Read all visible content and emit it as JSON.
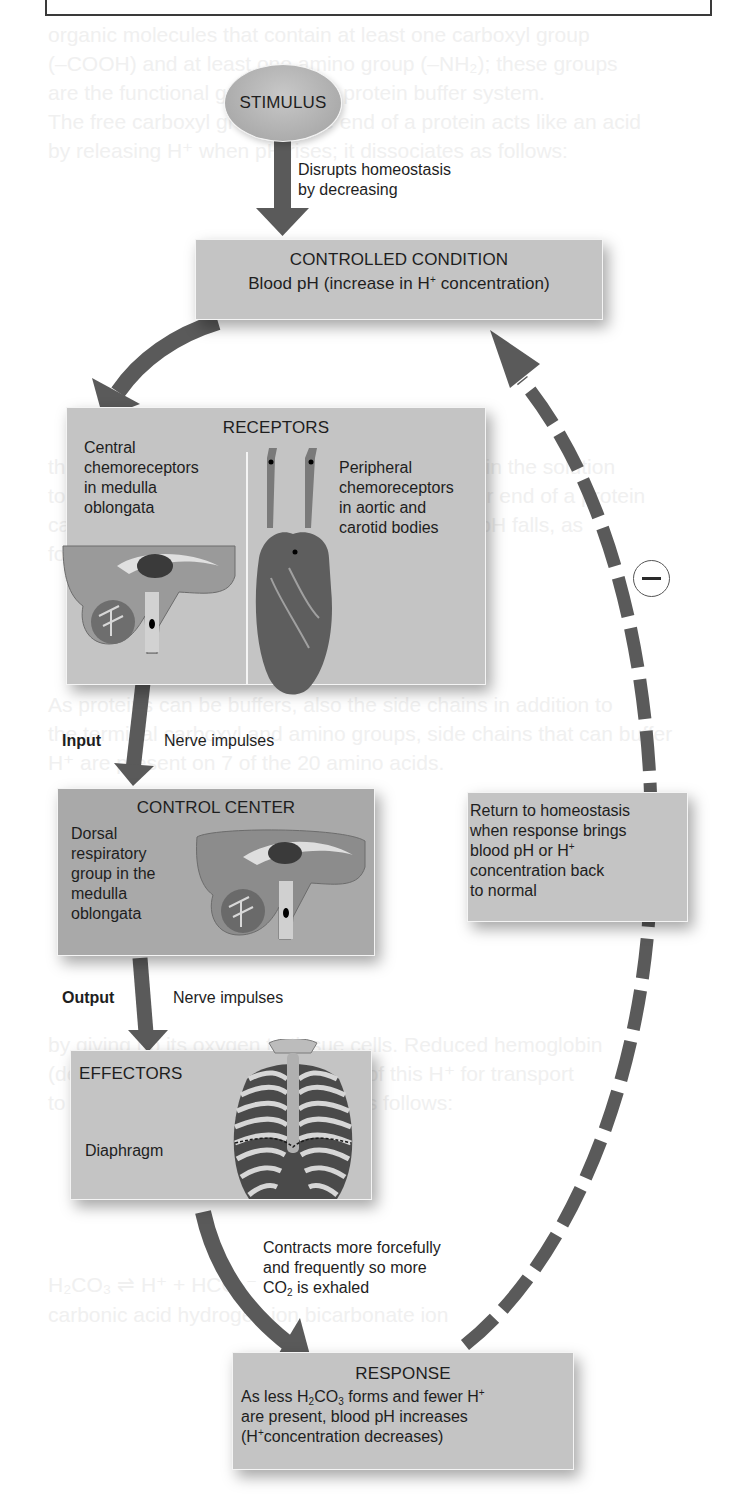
{
  "diagram": {
    "type": "negative-feedback-loop",
    "stimulus": {
      "label": "STIMULUS"
    },
    "stimulus_arrow": {
      "line1": "Disrupts homeostasis",
      "line2": "by decreasing"
    },
    "controlled_condition": {
      "title": "CONTROLLED CONDITION",
      "text_pre": "Blood pH (increase in H",
      "text_sup": "+",
      "text_post": " concentration)"
    },
    "receptors": {
      "title": "RECEPTORS",
      "central": {
        "lines": [
          "Central",
          "chemoreceptors",
          "in medulla",
          "oblongata"
        ],
        "image": "brain-sagittal-section"
      },
      "peripheral": {
        "lines": [
          "Peripheral",
          "chemoreceptors",
          "in aortic and",
          "carotid bodies"
        ],
        "image": "heart-with-carotid-arteries"
      }
    },
    "input_arrow": {
      "label": "Input",
      "text": "Nerve impulses"
    },
    "control_center": {
      "title": "CONTROL CENTER",
      "lines": [
        "Dorsal",
        "respiratory",
        "group in the",
        "medulla",
        "oblongata"
      ],
      "image": "brain-sagittal-section"
    },
    "output_arrow": {
      "label": "Output",
      "text": "Nerve impulses"
    },
    "effectors": {
      "title": "EFFECTORS",
      "text": "Diaphragm",
      "image": "rib-cage-with-diaphragm"
    },
    "effector_arrow": {
      "line1": "Contracts more forcefully",
      "line2": "and frequently so more",
      "line3_pre": "CO",
      "line3_sub": "2",
      "line3_post": " is exhaled"
    },
    "response": {
      "title": "RESPONSE",
      "line1_a": "As less H",
      "line1_sub1": "2",
      "line1_b": "CO",
      "line1_sub2": "3",
      "line1_c": " forms and fewer H",
      "line1_sup": "+",
      "line2": "are present, blood pH increases",
      "line3_a": "(H",
      "line3_sup": "+",
      "line3_b": "concentration decreases)"
    },
    "return_box": {
      "line1": "Return to homeostasis",
      "line2": "when response brings",
      "line3_pre": "blood pH or H",
      "line3_sup": "+",
      "line4": "concentration back",
      "line5": "to normal"
    },
    "feedback_sign": {
      "symbol": "minus",
      "meaning": "negative feedback"
    },
    "colors": {
      "box_fill": "#c4c4c4",
      "box_fill_dark": "#a9a9a9",
      "arrow": "#5a5a5a",
      "text": "#1e1e1e",
      "background": "#ffffff"
    }
  }
}
